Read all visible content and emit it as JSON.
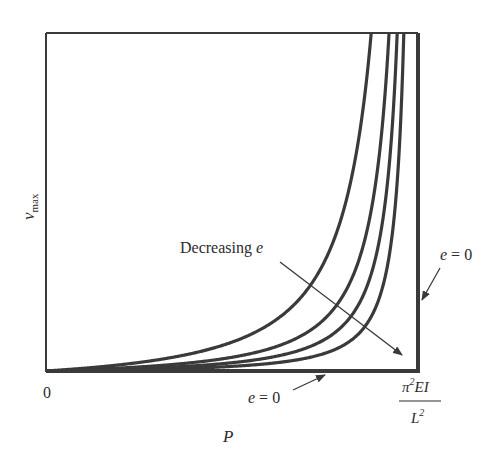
{
  "diagram": {
    "y_axis_label": "v",
    "y_axis_label_subscript": "max",
    "x_axis_label": "P",
    "origin_label": "0",
    "critical_load_label": {
      "numerator_symbol": "π",
      "numerator_exponent": "2",
      "numerator_rest": "EI",
      "denominator_symbol": "L",
      "denominator_exponent": "2"
    },
    "annotations": {
      "decreasing_e": {
        "text": "Decreasing ",
        "variable": "e"
      },
      "e_zero_right": {
        "variable": "e",
        "rest": " = 0"
      },
      "e_zero_bottom": {
        "variable": "e",
        "rest": " = 0"
      }
    },
    "colors": {
      "curve": "#3a3a3a",
      "frame": "#3a3a3a",
      "arrow": "#3a3a3a",
      "text": "#2b2b2b",
      "background": "#ffffff"
    }
  },
  "chart_data": {
    "type": "line",
    "title": "",
    "xlabel": "P",
    "ylabel": "v_max",
    "x_range_fraction_of_critical_load": [
      0,
      1
    ],
    "y_range_normalized": [
      0,
      1
    ],
    "x_ticks": [
      "0",
      "π²EI/L²"
    ],
    "model": "v = e * (1/(1 - P/Pcr)^1.5 - 1) (normalized, approximate fit of drawn curves)",
    "series": [
      {
        "name": "curve-1 (largest e)",
        "e": 0.0467
      },
      {
        "name": "curve-2",
        "e": 0.0222
      },
      {
        "name": "curve-3",
        "e": 0.0134
      },
      {
        "name": "curve-4 (smallest nonzero e)",
        "e": 0.0075
      },
      {
        "name": "e = 0",
        "e": 0,
        "description": "v = 0 until P = Pcr, then vertical"
      }
    ],
    "grid": false,
    "legend": "none"
  }
}
